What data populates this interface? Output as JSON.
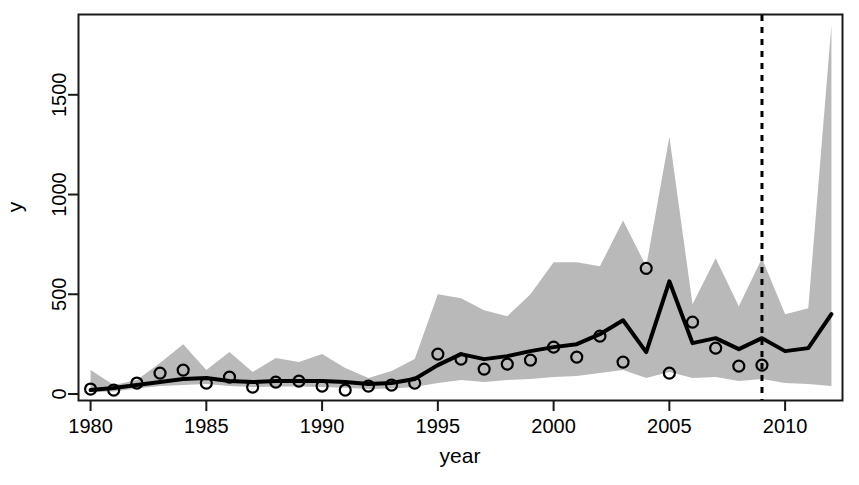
{
  "chart_data": {
    "type": "line",
    "title": "",
    "subtitle": "",
    "xlabel": "year",
    "ylabel": "y",
    "xlim": [
      1979.5,
      2012.5
    ],
    "ylim": [
      -30,
      1900
    ],
    "grid": false,
    "legend": null,
    "x_ticks": [
      1980,
      1985,
      1990,
      1995,
      2000,
      2005,
      2010
    ],
    "x_tick_labels": [
      "1980",
      "1985",
      "1990",
      "1995",
      "2000",
      "2005",
      "2010"
    ],
    "y_ticks": [
      0,
      500,
      1000,
      1500
    ],
    "y_tick_labels": [
      "0",
      "500",
      "1000",
      "1500"
    ],
    "x": [
      1980,
      1981,
      1982,
      1983,
      1984,
      1985,
      1986,
      1987,
      1988,
      1989,
      1990,
      1991,
      1992,
      1993,
      1994,
      1995,
      1996,
      1997,
      1998,
      1999,
      2000,
      2001,
      2002,
      2003,
      2004,
      2005,
      2006,
      2007,
      2008,
      2009,
      2010,
      2011,
      2012
    ],
    "series": [
      {
        "name": "fitted",
        "type": "line",
        "color": "#000000",
        "linewidth": 4,
        "values": [
          20,
          30,
          45,
          60,
          75,
          80,
          65,
          60,
          65,
          65,
          65,
          60,
          50,
          55,
          75,
          145,
          200,
          175,
          190,
          215,
          235,
          250,
          300,
          370,
          210,
          565,
          255,
          280,
          225,
          280,
          215,
          230,
          400
        ]
      },
      {
        "name": "observations",
        "type": "scatter",
        "marker": "open-circle",
        "color": "#000000",
        "values": [
          25,
          20,
          55,
          105,
          120,
          55,
          85,
          35,
          60,
          65,
          40,
          20,
          40,
          45,
          55,
          200,
          175,
          125,
          150,
          170,
          235,
          185,
          290,
          160,
          630,
          105,
          360,
          230,
          140,
          145,
          null,
          null,
          null
        ]
      }
    ],
    "ribbon": {
      "name": "credible-interval",
      "color": "#b5b5b5",
      "lower": [
        10,
        12,
        28,
        40,
        45,
        50,
        40,
        35,
        38,
        38,
        35,
        32,
        25,
        28,
        35,
        55,
        70,
        60,
        70,
        75,
        85,
        90,
        105,
        120,
        80,
        110,
        80,
        85,
        65,
        75,
        55,
        50,
        40
      ],
      "upper": [
        120,
        45,
        70,
        155,
        250,
        120,
        210,
        110,
        180,
        160,
        200,
        130,
        80,
        115,
        175,
        500,
        480,
        420,
        390,
        500,
        660,
        660,
        640,
        870,
        640,
        1290,
        450,
        680,
        440,
        680,
        400,
        430,
        1850
      ]
    },
    "annotations": [
      {
        "type": "vertical-dashed-line",
        "name": "forecast-start-line",
        "x": 2009,
        "color": "#000000",
        "dash": "6,6"
      }
    ]
  }
}
